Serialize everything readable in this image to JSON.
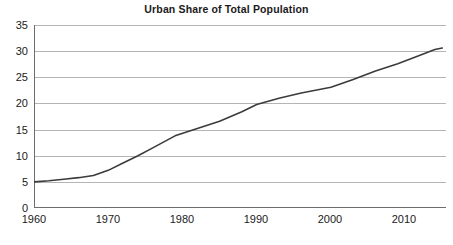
{
  "chart_data": {
    "type": "line",
    "title": "Urban Share of Total Population",
    "xlabel": "",
    "ylabel": "",
    "xlim": [
      1960,
      2015.5
    ],
    "ylim": [
      0,
      35
    ],
    "grid": true,
    "legend": "none",
    "xticks": [
      1960,
      1970,
      1980,
      1990,
      2000,
      2010
    ],
    "xtick_labels": [
      "1960",
      "1970",
      "1980",
      "1990",
      "2000",
      "2010"
    ],
    "yticks": [
      0,
      5,
      10,
      15,
      20,
      25,
      30,
      35
    ],
    "ytick_labels": [
      "0",
      "5",
      "10",
      "15",
      "20",
      "25",
      "30",
      "35"
    ],
    "series": [
      {
        "name": "Urban share of total population",
        "color": "#3b3b3b",
        "x": [
          1960,
          1962,
          1964,
          1966,
          1968,
          1970,
          1972,
          1974,
          1976,
          1979,
          1982,
          1985,
          1988,
          1990,
          1993,
          1996,
          2000,
          2003,
          2006,
          2009,
          2012,
          2014,
          2015
        ],
        "values": [
          5.0,
          5.2,
          5.5,
          5.8,
          6.2,
          7.2,
          8.6,
          10.0,
          11.5,
          13.8,
          15.2,
          16.6,
          18.4,
          19.8,
          21.0,
          22.0,
          23.1,
          24.6,
          26.2,
          27.6,
          29.2,
          30.3,
          30.6
        ]
      }
    ]
  },
  "axis_style": {
    "gridline_color": "#b5b5b5",
    "axis_color": "#6d6d6d",
    "text_color": "#1a1a1a"
  }
}
